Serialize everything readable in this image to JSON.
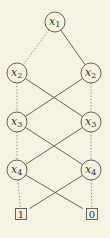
{
  "diagram": {
    "type": "binary-decision-diagram",
    "nodes": [
      {
        "id": "n1",
        "var": "x",
        "sub": "1",
        "level": 0,
        "col": "center"
      },
      {
        "id": "n2L",
        "var": "x",
        "sub": "2",
        "level": 1,
        "col": "left"
      },
      {
        "id": "n2R",
        "var": "x",
        "sub": "2",
        "level": 1,
        "col": "right"
      },
      {
        "id": "n3L",
        "var": "x",
        "sub": "3",
        "level": 2,
        "col": "left"
      },
      {
        "id": "n3R",
        "var": "x",
        "sub": "3",
        "level": 2,
        "col": "right"
      },
      {
        "id": "n4L",
        "var": "x",
        "sub": "4",
        "level": 3,
        "col": "left"
      },
      {
        "id": "n4R",
        "var": "x",
        "sub": "4",
        "level": 3,
        "col": "right"
      }
    ],
    "terminals": [
      {
        "id": "t1",
        "label": "1",
        "col": "left"
      },
      {
        "id": "t0",
        "label": "0",
        "col": "right"
      }
    ],
    "edges": [
      {
        "from": "n1",
        "to": "n2L",
        "style": "dotted"
      },
      {
        "from": "n1",
        "to": "n2R",
        "style": "solid"
      },
      {
        "from": "n2L",
        "to": "n3L",
        "style": "dotted"
      },
      {
        "from": "n2L",
        "to": "n3R",
        "style": "solid"
      },
      {
        "from": "n2R",
        "to": "n3R",
        "style": "dotted"
      },
      {
        "from": "n2R",
        "to": "n3L",
        "style": "solid"
      },
      {
        "from": "n3L",
        "to": "n4L",
        "style": "dotted"
      },
      {
        "from": "n3L",
        "to": "n4R",
        "style": "solid"
      },
      {
        "from": "n3R",
        "to": "n4R",
        "style": "dotted"
      },
      {
        "from": "n3R",
        "to": "n4L",
        "style": "solid"
      },
      {
        "from": "n4L",
        "to": "t1",
        "style": "dotted"
      },
      {
        "from": "n4L",
        "to": "t0",
        "style": "solid"
      },
      {
        "from": "n4R",
        "to": "t0",
        "style": "dotted"
      },
      {
        "from": "n4R",
        "to": "t1",
        "style": "solid"
      }
    ]
  }
}
